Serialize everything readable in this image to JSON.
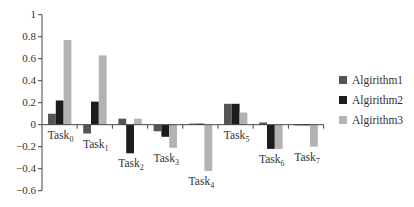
{
  "chart_data": {
    "type": "bar",
    "title": "",
    "xlabel": "",
    "ylabel": "",
    "ylim": [
      -0.6,
      1
    ],
    "yticks": [
      1,
      0.8,
      0.6,
      0.4,
      0.2,
      0,
      -0.2,
      -0.4,
      -0.6
    ],
    "ytick_labels": [
      "1",
      "0.8",
      "0.6",
      "0.4",
      "0.2",
      "0",
      "−0.2",
      "−0.4",
      "−0.6"
    ],
    "grid": false,
    "legend_position": "right",
    "categories": [
      {
        "base": "Task",
        "sub": "0"
      },
      {
        "base": "Task",
        "sub": "1"
      },
      {
        "base": "Task",
        "sub": "2"
      },
      {
        "base": "Task",
        "sub": "3"
      },
      {
        "base": "Task",
        "sub": "4"
      },
      {
        "base": "Task",
        "sub": "5"
      },
      {
        "base": "Task",
        "sub": "6"
      },
      {
        "base": "Task",
        "sub": "7"
      }
    ],
    "series": [
      {
        "name": "Algirithm1",
        "color": "#555555",
        "values": [
          0.1,
          -0.08,
          0.055,
          -0.06,
          0.01,
          0.19,
          0.02,
          0.005
        ]
      },
      {
        "name": "Algirithm2",
        "color": "#1c1c1c",
        "values": [
          0.22,
          0.21,
          -0.26,
          -0.11,
          0.01,
          0.19,
          -0.22,
          0.005
        ]
      },
      {
        "name": "Algirithm3",
        "color": "#b3b3b3",
        "values": [
          0.77,
          0.63,
          0.055,
          -0.21,
          -0.42,
          0.11,
          -0.22,
          -0.2
        ]
      }
    ]
  },
  "legend": {
    "items": [
      {
        "label": "Algirithm1",
        "color": "#555555"
      },
      {
        "label": "Algirithm2",
        "color": "#1c1c1c"
      },
      {
        "label": "Algirithm3",
        "color": "#b3b3b3"
      }
    ]
  }
}
